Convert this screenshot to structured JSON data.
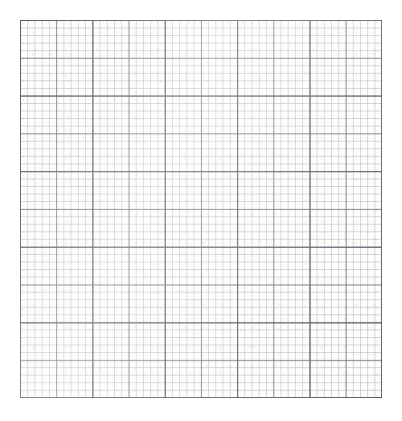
{
  "document": {
    "kind": "graph-paper",
    "title": "Blank Graph Paper Sheet",
    "description": "Scanned blank quadrille / graph paper with no plotted data, labels or annotations.",
    "has_text": false,
    "has_data_marks": false
  },
  "canvas": {
    "width_px": 402,
    "height_px": 421,
    "background_color": "#ffffff",
    "margin_left_px": 20,
    "margin_top_px": 20,
    "margin_right_px": 20,
    "margin_bottom_px": 23
  },
  "sheet": {
    "left_px": 20,
    "top_px": 20,
    "width_px": 362,
    "height_px": 378,
    "paper_color": "#fdfdfc"
  },
  "grid": {
    "levels": [
      {
        "name": "fine",
        "label": "fine-grid",
        "cell_width_px": 7.24,
        "cell_height_px": 7.56,
        "columns": 50,
        "rows": 50,
        "stroke_color": "#9698a0",
        "stroke_opacity": 0.42,
        "stroke_width_px": 0.7
      },
      {
        "name": "medium",
        "label": "medium-grid",
        "cell_width_px": 36.2,
        "cell_height_px": 37.8,
        "columns": 10,
        "rows": 10,
        "stroke_color": "#6e707a",
        "stroke_opacity": 0.75,
        "stroke_width_px": 0.8
      },
      {
        "name": "major",
        "label": "major-grid",
        "cell_width_px": 72.4,
        "cell_height_px": 75.6,
        "columns": 5,
        "rows": 5,
        "stroke_color": "#585a63",
        "stroke_opacity": 0.95,
        "stroke_width_px": 1.05
      }
    ],
    "major_vertical_line_positions_px": [
      20,
      92,
      165,
      237,
      309,
      382
    ],
    "major_horizontal_line_positions_px": [
      20,
      96,
      171,
      247,
      323,
      398
    ],
    "subdivisions_per_major_cell": 10
  },
  "chart_data": {
    "type": "table",
    "title": "",
    "subtitle": "",
    "xlabel": "",
    "ylabel": "",
    "categories": [],
    "values": [],
    "series": [],
    "annotations": [],
    "legend": [],
    "grid": true,
    "note": "Empty graph paper: the image contains only the ruled grid; no series, ticks, labels or data points are drawn."
  }
}
